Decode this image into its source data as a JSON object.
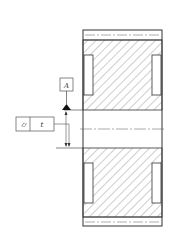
{
  "drawing": {
    "type": "cross-section of gear/wheel with geometric tolerance callout",
    "datum_label": "A",
    "tolerance_frame": {
      "symbol": "cylindricity-icon",
      "symbol_glyph": "⌭",
      "value": "t"
    },
    "colors": {
      "line": "#333333",
      "hatch": "#555555",
      "background": "#ffffff"
    }
  }
}
